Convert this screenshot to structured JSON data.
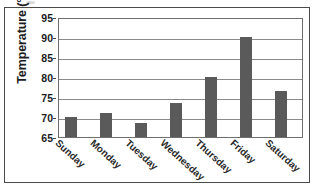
{
  "chart_data": {
    "type": "bar",
    "title": "",
    "xlabel": "",
    "ylabel": "Temperature (°F)",
    "categories": [
      "Sunday",
      "Monday",
      "Tuesday",
      "Wednesday",
      "Thursday",
      "Friday",
      "Saturday"
    ],
    "values": [
      70,
      71,
      68.5,
      73.5,
      80,
      90,
      76.5
    ],
    "ylim": [
      65,
      95
    ],
    "yticks": [
      65,
      70,
      75,
      80,
      85,
      90,
      95
    ],
    "ytick_labels": [
      "65",
      "70",
      "75",
      "80",
      "85",
      "90",
      "95"
    ],
    "grid": "horizontal",
    "legend": "none",
    "bar_color": "#5a5a5a",
    "gridline_color": "#8a8a8a",
    "axis_color": "#6e6e6e",
    "frame_color": "#4a4a4a",
    "background_color": "#ffffff"
  }
}
